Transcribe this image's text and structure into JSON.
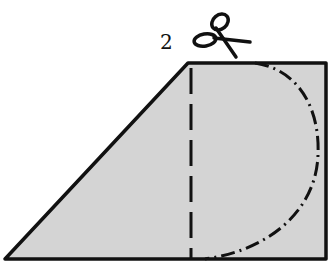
{
  "figure": {
    "step_label": "2",
    "icons": [
      "scissors-icon"
    ],
    "colors": {
      "fill": "#d4d4d4",
      "stroke": "#111111",
      "background": "#ffffff"
    },
    "shape": {
      "outline": [
        [
          5,
          259
        ],
        [
          188,
          63
        ],
        [
          326,
          63
        ],
        [
          326,
          259
        ]
      ],
      "fold_line_x": 191,
      "cut_arc": {
        "start": [
          255,
          63
        ],
        "end": [
          205,
          259
        ],
        "rightmost_x": 318
      }
    }
  }
}
